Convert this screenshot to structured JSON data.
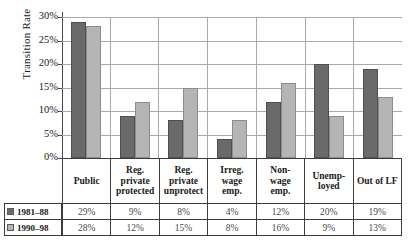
{
  "chart_data": {
    "type": "bar",
    "title": "",
    "xlabel": "",
    "ylabel": "Transition Rate",
    "ylim": [
      0,
      30
    ],
    "ytick_labels": [
      "30%",
      "25%",
      "20%",
      "15%",
      "10%",
      "5%",
      "0%"
    ],
    "ytick_values": [
      30,
      25,
      20,
      15,
      10,
      5,
      0
    ],
    "grid": true,
    "legend_position": "table-left",
    "categories": [
      "Public",
      "Reg. private protected",
      "Reg. private unprotect",
      "Irreg. wage emp.",
      "Non-wage emp.",
      "Unemp-loyed",
      "Out of LF"
    ],
    "category_lines": [
      [
        "Public"
      ],
      [
        "Reg.",
        "private",
        "protected"
      ],
      [
        "Reg.",
        "private",
        "unprotect"
      ],
      [
        "Irreg.",
        "wage",
        "emp."
      ],
      [
        "Non-",
        "wage",
        "emp."
      ],
      [
        "Unemp-",
        "loyed"
      ],
      [
        "Out of LF"
      ]
    ],
    "series": [
      {
        "name": "1981–88",
        "color": "#6a6a6a",
        "values": [
          29,
          9,
          8,
          4,
          12,
          20,
          19
        ],
        "value_labels": [
          "29%",
          "9%",
          "8%",
          "4%",
          "12%",
          "20%",
          "19%"
        ]
      },
      {
        "name": "1990–98",
        "color": "#b5b5b5",
        "values": [
          28,
          12,
          15,
          8,
          16,
          9,
          13
        ],
        "value_labels": [
          "28%",
          "12%",
          "15%",
          "8%",
          "16%",
          "9%",
          "13%"
        ]
      }
    ]
  }
}
